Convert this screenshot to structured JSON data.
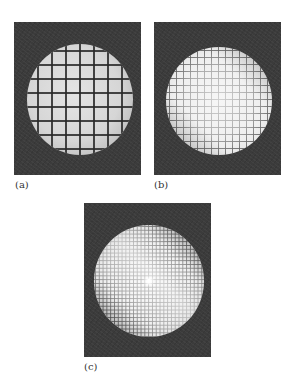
{
  "figure": {
    "panels": [
      {
        "id": "a",
        "label": "(a)",
        "description": "Circular field of view with coarse square grid",
        "grid_spacing_px": 14,
        "background_color": "#3b3b3b",
        "disc_color": "#d6d6d6",
        "grid_line_color": "#282828"
      },
      {
        "id": "b",
        "label": "(b)",
        "description": "Circular field of view with medium grid, contrast fading toward center",
        "grid_spacing_px": 7,
        "background_color": "#3b3b3b",
        "disc_color": "#efefef",
        "grid_line_color": "#1e1e1e"
      },
      {
        "id": "c",
        "label": "(c)",
        "description": "Circular field of view with fine grid, bright central spot, dark grid at top-right and bottom-left",
        "grid_spacing_px": 4,
        "background_color": "#3b3b3b",
        "disc_color": "#f0f0f0",
        "grid_line_color": "#191919"
      }
    ]
  }
}
